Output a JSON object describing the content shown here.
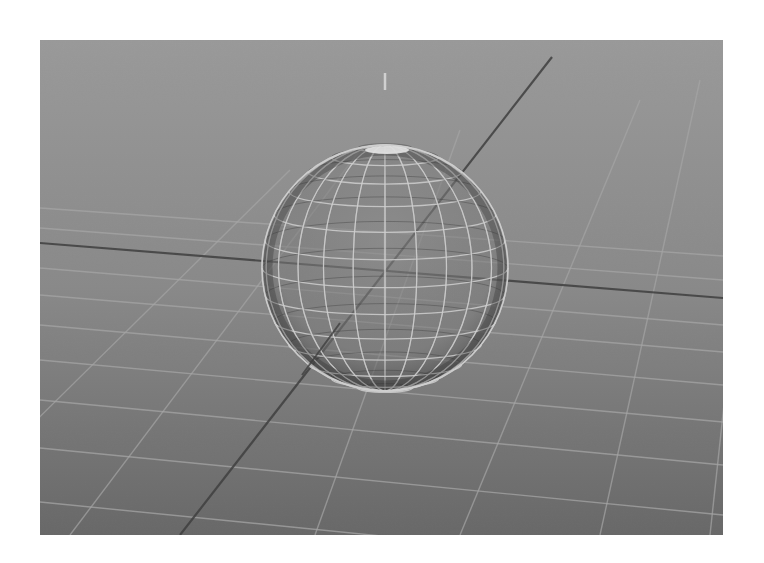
{
  "viewport": {
    "x": 40,
    "y": 40,
    "width": 683,
    "height": 495,
    "colors": {
      "bg_top": "#9c9c9c",
      "bg_mid": "#8a8a8a",
      "bg_bottom": "#676767",
      "grid_line": "#a9a9a9",
      "axis_line": "#3a3a3a",
      "wire_light": "#d6d6d6",
      "wire_dark": "#2e2e2e",
      "sphere_fill": "#858585",
      "pole_highlight": "#eeeeee"
    }
  },
  "axes": {
    "x_axis": {
      "x1": 0,
      "y1": 203,
      "x2": 683,
      "y2": 258
    },
    "z_axis": {
      "x1": 512,
      "y1": 17,
      "x2": 140,
      "y2": 495
    },
    "y_axis_tick": {
      "x1": 345,
      "y1": 33,
      "x2": 345,
      "y2": 50
    }
  },
  "sphere": {
    "cx": 345,
    "cy": 228,
    "r": 123,
    "latitude_count": 14,
    "longitude_count": 12
  },
  "grid": {
    "horizontal": [
      {
        "x1": 0,
        "y1": 228,
        "x2": 683,
        "y2": 285
      },
      {
        "x1": 0,
        "y1": 255,
        "x2": 683,
        "y2": 312
      },
      {
        "x1": 0,
        "y1": 285,
        "x2": 683,
        "y2": 345
      },
      {
        "x1": 0,
        "y1": 320,
        "x2": 683,
        "y2": 382
      },
      {
        "x1": 0,
        "y1": 360,
        "x2": 683,
        "y2": 425
      },
      {
        "x1": 0,
        "y1": 408,
        "x2": 683,
        "y2": 475
      },
      {
        "x1": 0,
        "y1": 462,
        "x2": 683,
        "y2": 530
      },
      {
        "x1": 0,
        "y1": 188,
        "x2": 683,
        "y2": 240
      },
      {
        "x1": 0,
        "y1": 168,
        "x2": 683,
        "y2": 216
      }
    ],
    "receding": [
      {
        "x1": 660,
        "y1": 40,
        "x2": 560,
        "y2": 495
      },
      {
        "x1": 600,
        "y1": 60,
        "x2": 420,
        "y2": 495
      },
      {
        "x1": 420,
        "y1": 90,
        "x2": 275,
        "y2": 495
      },
      {
        "x1": 320,
        "y1": 110,
        "x2": 30,
        "y2": 495
      },
      {
        "x1": 250,
        "y1": 130,
        "x2": -120,
        "y2": 495
      },
      {
        "x1": 720,
        "y1": 30,
        "x2": 670,
        "y2": 495
      }
    ]
  }
}
